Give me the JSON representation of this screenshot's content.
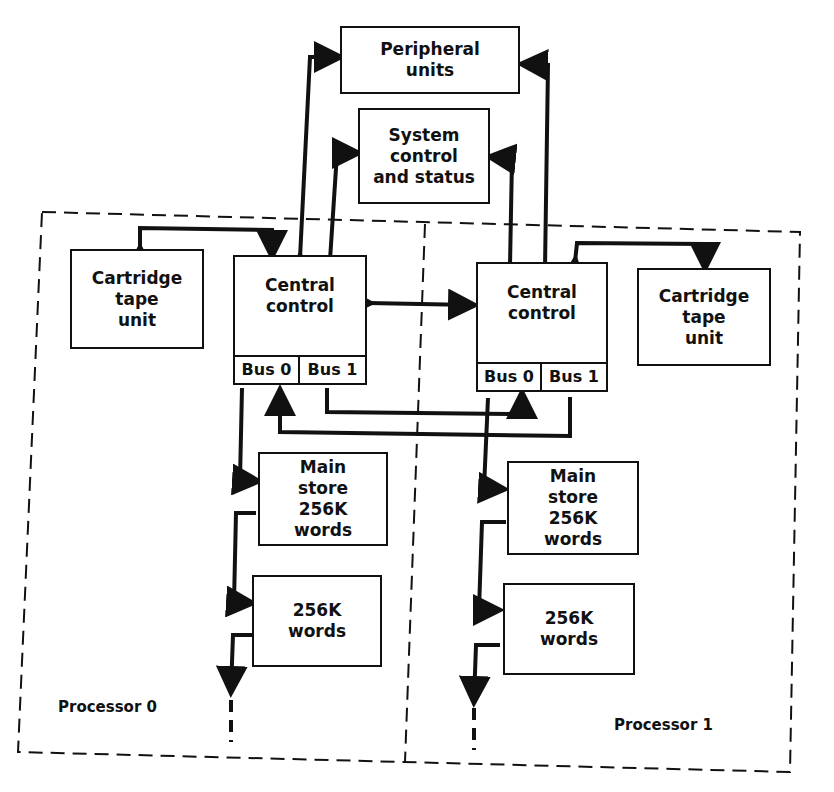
{
  "diagram": {
    "top_blocks": {
      "peripheral": "Peripheral\nunits",
      "system_control": "System\ncontrol\nand status"
    },
    "processors": [
      {
        "label": "Processor 0",
        "cartridge": "Cartridge\ntape\nunit",
        "central_control": "Central\ncontrol",
        "bus0": "Bus 0",
        "bus1": "Bus 1",
        "main_store": "Main\nstore\n256K\nwords",
        "extra_store": "256K\nwords"
      },
      {
        "label": "Processor 1",
        "cartridge": "Cartridge\ntape\nunit",
        "central_control": "Central\ncontrol",
        "bus0": "Bus 0",
        "bus1": "Bus 1",
        "main_store": "Main\nstore\n256K\nwords",
        "extra_store": "256K\nwords"
      }
    ],
    "colors": {
      "line": "#111111",
      "background": "#ffffff"
    }
  }
}
